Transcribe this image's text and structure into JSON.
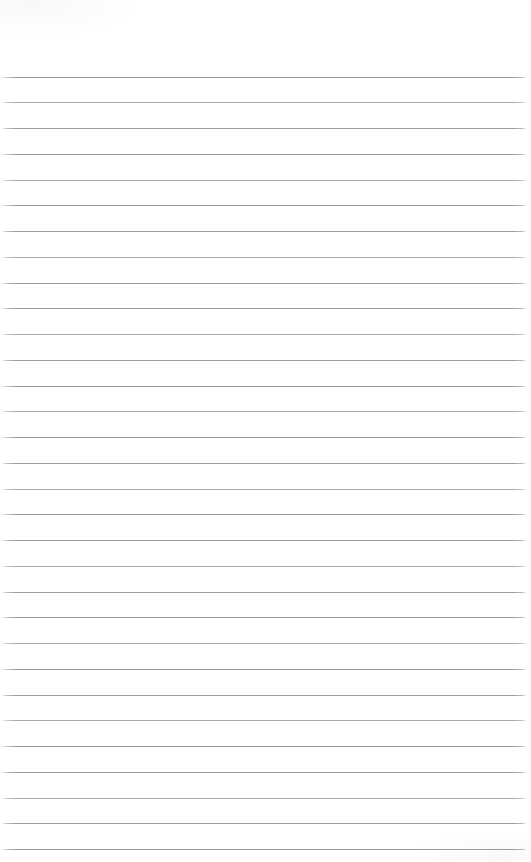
{
  "document": {
    "kind": "lined-paper-scan",
    "title": "Blank ruled notepad page",
    "page_width": 531,
    "page_height": 862,
    "background_color": "#ffffff",
    "visible_text": "",
    "has_handwriting": false,
    "has_printed_text": false
  },
  "ruling": {
    "line_color": "#9b9ca0",
    "line_color_light": "#a9aaae",
    "line_thickness_px": 1,
    "line_spacing_px": 25.75,
    "first_line_y": 76.5,
    "last_line_y": 849,
    "line_count": 31,
    "line_start_x": 2,
    "line_end_x": 526,
    "line_length_px": 524,
    "orientation": "horizontal"
  },
  "margins": {
    "top_blank_height_px": 76,
    "bottom_blank_height_px": 13,
    "left_inset_px": 2,
    "right_inset_px": 5,
    "header_label": "",
    "footer_label": ""
  },
  "line_y_positions": [
    76.5,
    102.25,
    128,
    153.75,
    179.5,
    205.25,
    231,
    256.75,
    282.5,
    308.25,
    334,
    359.75,
    385.5,
    411.25,
    437,
    462.75,
    488.5,
    514.25,
    540,
    565.75,
    591.5,
    617.25,
    643,
    668.75,
    694.5,
    720.25,
    746,
    771.75,
    797.5,
    823.25,
    849
  ]
}
